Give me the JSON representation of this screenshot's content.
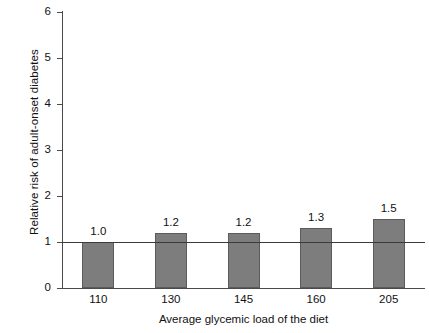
{
  "chart_data": {
    "type": "bar",
    "title": "",
    "xlabel": "Average glycemic load of the diet",
    "ylabel": "Relative risk of adult-onset diabetes",
    "categories": [
      "110",
      "130",
      "145",
      "160",
      "205"
    ],
    "values": [
      1.0,
      1.2,
      1.2,
      1.3,
      1.5
    ],
    "value_labels": [
      "1.0",
      "1.2",
      "1.2",
      "1.3",
      "1.5"
    ],
    "ylim": [
      0,
      6
    ],
    "y_ticks": [
      "0",
      "1",
      "2",
      "3",
      "4",
      "5",
      "6"
    ],
    "y_tick_values": [
      0,
      1,
      2,
      3,
      4,
      5,
      6
    ],
    "grid": false,
    "legend": "none",
    "reference_line": 1,
    "bar_color": "#7d7d7d",
    "bar_border_color": "#5b5b5b",
    "axis_color": "#4a4a4a",
    "background": "#ffffff"
  }
}
